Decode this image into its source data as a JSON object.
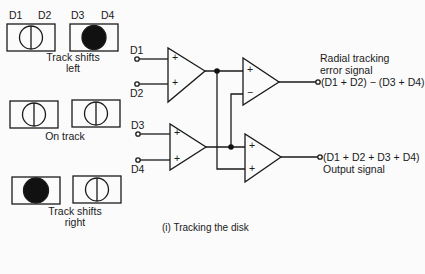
{
  "detectors": {
    "labels": [
      "D1",
      "D2",
      "D3",
      "D4"
    ]
  },
  "states": [
    {
      "id": "left",
      "caption_line1": "Track shifts",
      "caption_line2": "left",
      "pair_a": "outline",
      "pair_b": "filled"
    },
    {
      "id": "on",
      "caption_line1": "On track",
      "caption_line2": "",
      "pair_a": "outline",
      "pair_b": "outline"
    },
    {
      "id": "right",
      "caption_line1": "Track shifts",
      "caption_line2": "right",
      "pair_a": "filled",
      "pair_b": "outline"
    }
  ],
  "circuit": {
    "inputs": [
      "D1",
      "D2",
      "D3",
      "D4"
    ],
    "amp_signs": {
      "amp1": [
        "+",
        "+"
      ],
      "amp2": [
        "+",
        "−"
      ],
      "amp3": [
        "+",
        "+"
      ],
      "amp4": [
        "+",
        "+"
      ]
    },
    "outputs": {
      "error": {
        "line1": "Radial tracking",
        "line2": "error signal",
        "formula": "(D1 + D2) − (D3 + D4)"
      },
      "sum": {
        "formula": "(D1 + D2 + D3 + D4)",
        "label": "Output signal"
      }
    }
  },
  "caption": "(i)  Tracking the disk"
}
